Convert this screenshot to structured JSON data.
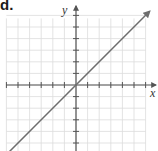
{
  "part_label": "d.",
  "chart_data": {
    "type": "line",
    "title": "",
    "xlabel": "x",
    "ylabel": "y",
    "grid": true,
    "xlim": [
      -6,
      6
    ],
    "ylim": [
      -6,
      6
    ],
    "x_ticks": [
      -6,
      -5,
      -4,
      -3,
      -2,
      -1,
      1,
      2,
      3,
      4,
      5,
      6
    ],
    "y_ticks": [
      -6,
      -5,
      -4,
      -3,
      -2,
      -1,
      1,
      2,
      3,
      4,
      5,
      6
    ],
    "tick_labels_shown": false,
    "series": [
      {
        "name": "y = x",
        "x": [
          -6,
          6
        ],
        "y": [
          -6,
          6
        ],
        "arrows": "both"
      }
    ]
  },
  "colors": {
    "grid": "#dcdcdc",
    "axis": "#555555",
    "line": "#6e6e6e"
  }
}
